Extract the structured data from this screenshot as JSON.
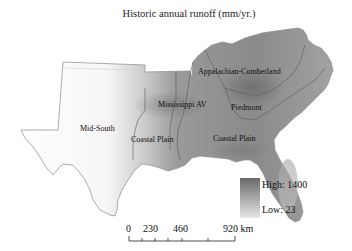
{
  "title": "Historic annual runoff (mm/yr.)",
  "regions": {
    "appalachian": "Appalachian-Cumberland",
    "mississippi": "Mississippi AV",
    "piedmont": "Piedmont",
    "midsouth": "Mid-South",
    "coastal_west": "Coastal Plain",
    "coastal_east": "Coastal Plain"
  },
  "legend": {
    "high_label": "High: 1400",
    "low_label": "Low: 23",
    "high_color": "#6a6a6a",
    "low_color": "#e6e6e6"
  },
  "scale_bar": {
    "ticks": [
      "0",
      "230",
      "460",
      "920 km"
    ]
  }
}
